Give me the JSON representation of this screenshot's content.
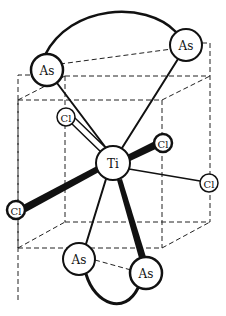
{
  "diagram": {
    "type": "molecular-structure",
    "central_atom": {
      "label": "Ti",
      "x": 113,
      "y": 163,
      "r": 17
    },
    "atoms": [
      {
        "id": "as1",
        "label": "As",
        "x": 47,
        "y": 70,
        "r": 16
      },
      {
        "id": "as2",
        "label": "As",
        "x": 186,
        "y": 45,
        "r": 16
      },
      {
        "id": "as3",
        "label": "As",
        "x": 79,
        "y": 259,
        "r": 16
      },
      {
        "id": "as4",
        "label": "As",
        "x": 146,
        "y": 273,
        "r": 16
      },
      {
        "id": "cl1",
        "label": "Cl",
        "x": 66,
        "y": 117,
        "r": 9
      },
      {
        "id": "cl2",
        "label": "Cl",
        "x": 163,
        "y": 143,
        "r": 9
      },
      {
        "id": "cl3",
        "label": "Cl",
        "x": 209,
        "y": 183,
        "r": 9
      },
      {
        "id": "cl4",
        "label": "Cl",
        "x": 16,
        "y": 210,
        "r": 9
      }
    ],
    "bonds": [
      {
        "from": "ti",
        "to": "as1",
        "style": "single"
      },
      {
        "from": "ti",
        "to": "as2",
        "style": "single"
      },
      {
        "from": "ti",
        "to": "as3",
        "style": "single"
      },
      {
        "from": "ti",
        "to": "as4",
        "style": "wedge"
      },
      {
        "from": "ti",
        "to": "cl1",
        "style": "open-wedge"
      },
      {
        "from": "ti",
        "to": "cl2",
        "style": "wedge"
      },
      {
        "from": "ti",
        "to": "cl3",
        "style": "single-thin"
      },
      {
        "from": "ti",
        "to": "cl4",
        "style": "wedge"
      }
    ],
    "chelate_arcs": [
      {
        "from": "as1",
        "to": "as2"
      },
      {
        "from": "as3",
        "to": "as4"
      }
    ],
    "colors": {
      "line": "#111111",
      "background": "#ffffff"
    }
  }
}
